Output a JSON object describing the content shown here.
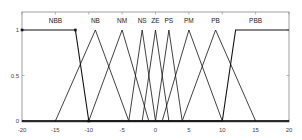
{
  "chart_data": {
    "type": "line",
    "title": "",
    "xlabel": "",
    "ylabel": "",
    "xlim": [
      -20,
      20
    ],
    "ylim": [
      0,
      1
    ],
    "grid": false,
    "x_ticks": [
      -20,
      -15,
      -10,
      -5,
      0,
      5,
      10,
      15,
      20
    ],
    "x_tick_labels": [
      "-20",
      "-15",
      "-10",
      "-5",
      "0",
      "5",
      "10",
      "15",
      "20"
    ],
    "y_ticks": [
      0,
      0.5,
      1
    ],
    "y_tick_labels": [
      "0",
      "0.5",
      "1"
    ],
    "series": [
      {
        "name": "NBB",
        "x": [
          -20,
          -12,
          -10,
          20
        ],
        "y": [
          1,
          1,
          0,
          0
        ],
        "label_x": -15
      },
      {
        "name": "NB",
        "x": [
          -15,
          -9,
          -4
        ],
        "y": [
          0,
          1,
          0
        ],
        "label_x": -9
      },
      {
        "name": "NM",
        "x": [
          -10,
          -5,
          -1
        ],
        "y": [
          0,
          1,
          0
        ],
        "label_x": -5
      },
      {
        "name": "NS",
        "x": [
          -4,
          -2,
          0
        ],
        "y": [
          0,
          1,
          0
        ],
        "label_x": -2
      },
      {
        "name": "ZE",
        "x": [
          -2,
          0,
          2
        ],
        "y": [
          0,
          1,
          0
        ],
        "label_x": 0
      },
      {
        "name": "PS",
        "x": [
          0,
          2,
          4
        ],
        "y": [
          0,
          1,
          0
        ],
        "label_x": 2
      },
      {
        "name": "PM",
        "x": [
          1,
          5,
          10
        ],
        "y": [
          0,
          1,
          0
        ],
        "label_x": 5
      },
      {
        "name": "PB",
        "x": [
          4,
          9,
          15
        ],
        "y": [
          0,
          1,
          0
        ],
        "label_x": 9
      },
      {
        "name": "PBB",
        "x": [
          -20,
          10,
          12,
          20
        ],
        "y": [
          0,
          0,
          1,
          1
        ],
        "label_x": 15
      }
    ]
  }
}
